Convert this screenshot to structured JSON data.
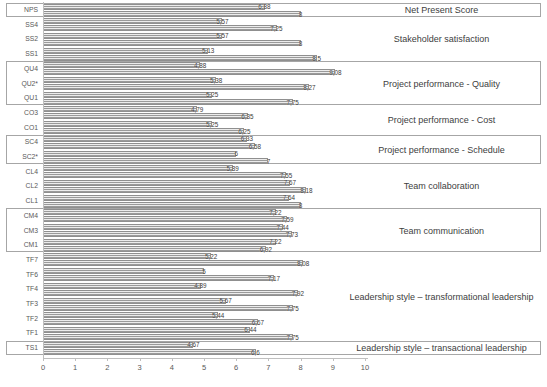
{
  "chart_data": {
    "type": "bar",
    "orientation": "horizontal",
    "title": "",
    "xlabel": "",
    "ylabel": "",
    "xlim": [
      0,
      10
    ],
    "x_ticks": [
      "0",
      "1",
      "2",
      "3",
      "4",
      "5",
      "6",
      "7",
      "8",
      "9",
      "10"
    ],
    "grid": false,
    "legend": "none",
    "decimal_separator": ",",
    "categories": [
      "NPS",
      "SS4",
      "SS2",
      "SS1",
      "QU4",
      "QU2*",
      "QU1",
      "CO3",
      "CO1",
      "SC4",
      "SC2*",
      "CL4",
      "CL2",
      "CL1",
      "CM4",
      "CM3",
      "CM1",
      "TF7",
      "TF6",
      "TF4",
      "TF3",
      "TF2",
      "TF1",
      "TS1"
    ],
    "series": [
      {
        "name": "upper-bar",
        "values": [
          6.88,
          5.57,
          5.57,
          5.13,
          4.88,
          5.38,
          5.25,
          4.79,
          5.25,
          6.33,
          6,
          5.89,
          7.67,
          7.64,
          7.22,
          7.44,
          7.22,
          5.22,
          5,
          4.89,
          5.67,
          5.44,
          6.44,
          4.67
        ],
        "value_labels": [
          "6,88",
          "5,57",
          "5,57",
          "5,13",
          "4,88",
          "5,38",
          "5,25",
          "4,79",
          "5,25",
          "6,33",
          "6",
          "5,89",
          "7,67",
          "7,64",
          "7,22",
          "7,44",
          "7,22",
          "5,22",
          "5",
          "4,89",
          "5,67",
          "5,44",
          "6,44",
          "4,67"
        ]
      },
      {
        "name": "lower-bar",
        "values": [
          8,
          7.25,
          8,
          8.5,
          9.08,
          8.27,
          7.75,
          6.35,
          6.25,
          6.58,
          7,
          7.55,
          8.18,
          8,
          7.59,
          7.73,
          6.92,
          8.08,
          7.17,
          7.92,
          7.75,
          6.67,
          7.75,
          6.6
        ],
        "value_labels": [
          "8",
          "7,25",
          "8",
          "8,5",
          "9,08",
          "8,27",
          "7,75",
          "6,35",
          "6,25",
          "6,58",
          "7",
          "7,55",
          "8,18",
          "8",
          "7,59",
          "7,73",
          "6,92",
          "8,08",
          "7,17",
          "7,92",
          "7,75",
          "6,67",
          "7,75",
          "6,6"
        ]
      }
    ],
    "groups": [
      {
        "label": "Net Present Score",
        "boxed": true,
        "start": 0,
        "count": 1
      },
      {
        "label": "Stakeholder satisfaction",
        "boxed": false,
        "start": 1,
        "count": 3
      },
      {
        "label": "Project performance - Quality",
        "boxed": true,
        "start": 4,
        "count": 3
      },
      {
        "label": "Project performance - Cost",
        "boxed": false,
        "start": 7,
        "count": 2
      },
      {
        "label": "Project performance - Schedule",
        "boxed": true,
        "start": 9,
        "count": 2
      },
      {
        "label": "Team collaboration",
        "boxed": false,
        "start": 11,
        "count": 3
      },
      {
        "label": "Team communication",
        "boxed": true,
        "start": 14,
        "count": 3
      },
      {
        "label": "Leadership style – transformational leadership",
        "boxed": false,
        "start": 17,
        "count": 6
      },
      {
        "label": "Leadership style – transactional leadership",
        "boxed": true,
        "start": 23,
        "count": 1
      }
    ],
    "colors": {
      "bar_stripe_dark": "#9a9a9a",
      "bar_stripe_light": "#ececec",
      "bar_border": "#8f8f8f",
      "box_border": "#a6a6a6",
      "axis": "#bfbfbf",
      "category_text": "#595959",
      "value_text": "#3a3a3a",
      "group_text": "#404040"
    }
  }
}
